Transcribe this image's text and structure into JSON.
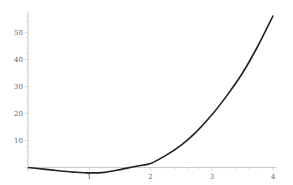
{
  "chart_data": {
    "type": "line",
    "title": "",
    "xlabel": "",
    "ylabel": "",
    "xlim": [
      0,
      4
    ],
    "ylim": [
      -3,
      57
    ],
    "grid": false,
    "legend": null,
    "x_ticks": [
      "1",
      "2",
      "3",
      "4"
    ],
    "y_ticks": [
      "10",
      "20",
      "30",
      "40",
      "50"
    ],
    "series": [
      {
        "name": "f(x)",
        "color": "#222222",
        "x": [
          0,
          0.25,
          0.5,
          0.75,
          1.0,
          1.25,
          1.5,
          1.75,
          2.0,
          2.25,
          2.5,
          2.75,
          3.0,
          3.25,
          3.5,
          3.75,
          4.0
        ],
        "y": [
          0,
          -0.6,
          -1.2,
          -1.7,
          -2.0,
          -1.8,
          -0.8,
          0.4,
          1.5,
          4.5,
          8.3,
          13.3,
          19.5,
          26.8,
          35.0,
          45.0,
          56.3
        ]
      }
    ]
  }
}
